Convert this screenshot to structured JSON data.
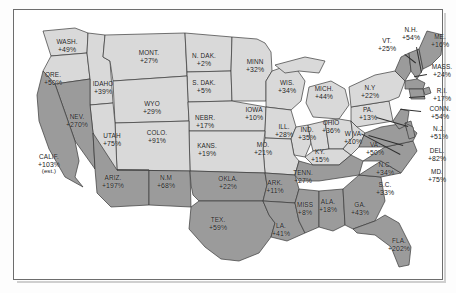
{
  "figure": {
    "kind": "choropleth-map",
    "region": "United States",
    "unit": "percent",
    "shade_high_hex": "#9b9b9b",
    "shade_low_hex": "#d9d9d9",
    "frame_hex": "#6d6d6d",
    "text_hex": "#1b1b1b"
  },
  "chart_data": {
    "type": "map",
    "title": "",
    "xlabel": "",
    "ylabel": "",
    "categories": [
      "WASH.",
      "ORE.",
      "IDAHO",
      "MONT.",
      "N. DAK.",
      "S. DAK.",
      "MINN",
      "WIS.",
      "MICH.",
      "WYO",
      "NEBR.",
      "IOWA",
      "ILL.",
      "IND.",
      "OHIO",
      "PA.",
      "N.Y",
      "VT.",
      "N.H.",
      "ME.",
      "MASS.",
      "R.I.",
      "CONN.",
      "N.J.",
      "DEL.",
      "MD.",
      "W VA",
      "VA.",
      "KY.",
      "MO.",
      "KANS.",
      "COLO.",
      "UTAH",
      "NEV.",
      "CALIF.",
      "ARIZ.",
      "N.M",
      "OKLA.",
      "TEX.",
      "ARK.",
      "LA.",
      "MISS.",
      "ALA.",
      "TENN.",
      "GA.",
      "S.C.",
      "N.C.",
      "FLA."
    ],
    "values": [
      49,
      50,
      39,
      27,
      2,
      5,
      32,
      34,
      44,
      29,
      17,
      10,
      28,
      35,
      36,
      13,
      22,
      25,
      54,
      16,
      24,
      17,
      54,
      51,
      82,
      75,
      10,
      50,
      15,
      21,
      19,
      91,
      75,
      270,
      103,
      197,
      68,
      22,
      59,
      11,
      41,
      8,
      18,
      27,
      43,
      33,
      34,
      202
    ],
    "legend": []
  },
  "states": [
    {
      "name": "WASH.",
      "value": "+49%",
      "x": 54,
      "y": 37,
      "shade": "low"
    },
    {
      "name": "ORE.",
      "value": "+50%",
      "x": 40,
      "y": 70,
      "shade": "low"
    },
    {
      "name": "IDAHO",
      "value": "+39%",
      "x": 90,
      "y": 79,
      "shade": "low"
    },
    {
      "name": "MONT.",
      "value": "+27%",
      "x": 136,
      "y": 48,
      "shade": "low"
    },
    {
      "name": "N. DAK.",
      "value": "+2%",
      "x": 191,
      "y": 51,
      "shade": "low"
    },
    {
      "name": "S. DAK.",
      "value": "+5%",
      "x": 191,
      "y": 78,
      "shade": "low"
    },
    {
      "name": "MINN",
      "value": "+32%",
      "x": 242,
      "y": 57,
      "shade": "low"
    },
    {
      "name": "WIS.",
      "value": "+34%",
      "x": 274,
      "y": 78,
      "shade": "low"
    },
    {
      "name": "MICH.",
      "value": "+44%",
      "x": 311,
      "y": 84,
      "shade": "low"
    },
    {
      "name": "WYO",
      "value": "+29%",
      "x": 139,
      "y": 99,
      "shade": "low"
    },
    {
      "name": "NEBR.",
      "value": "+17%",
      "x": 192,
      "y": 113,
      "shade": "low"
    },
    {
      "name": "IOWA",
      "value": "+10%",
      "x": 241,
      "y": 105,
      "shade": "low"
    },
    {
      "name": "ILL.",
      "value": "+28%",
      "x": 271,
      "y": 122,
      "shade": "low"
    },
    {
      "name": "IND.",
      "value": "+35%",
      "x": 294,
      "y": 125,
      "shade": "low"
    },
    {
      "name": "OHIO",
      "value": "+36%",
      "x": 318,
      "y": 118,
      "shade": "low"
    },
    {
      "name": "PA.",
      "value": "+13%",
      "x": 355,
      "y": 105,
      "shade": "low"
    },
    {
      "name": "N.Y",
      "value": "+22%",
      "x": 357,
      "y": 83,
      "shade": "low"
    },
    {
      "name": "KY.",
      "value": "+15%",
      "x": 307,
      "y": 147,
      "shade": "low"
    },
    {
      "name": "MO.",
      "value": "+21%",
      "x": 250,
      "y": 140,
      "shade": "low"
    },
    {
      "name": "KANS.",
      "value": "+19%",
      "x": 194,
      "y": 141,
      "shade": "low"
    },
    {
      "name": "COLO.",
      "value": "+91%",
      "x": 144,
      "y": 128,
      "shade": "low"
    },
    {
      "name": "UTAH",
      "value": "+75%",
      "x": 99,
      "y": 131,
      "shade": "low"
    },
    {
      "name": "NEV.",
      "value": "+270%",
      "x": 64,
      "y": 112,
      "shade": "high"
    },
    {
      "name": "W VA",
      "value": "+10%",
      "x": 340,
      "y": 129,
      "shade": "low"
    }
  ],
  "states_high": [
    {
      "name": "CALIF.",
      "value": "+103%",
      "note": "(est.)",
      "x": 36,
      "y": 155
    },
    {
      "name": "ARIZ.",
      "value": "+197%",
      "x": 100,
      "y": 173
    },
    {
      "name": "N.M",
      "value": "+68%",
      "x": 153,
      "y": 173
    },
    {
      "name": "OKLA.",
      "value": "+22%",
      "x": 215,
      "y": 174
    },
    {
      "name": "TEX.",
      "value": "+59%",
      "x": 205,
      "y": 215
    },
    {
      "name": "ARK.",
      "value": "+11%",
      "x": 262,
      "y": 178
    },
    {
      "name": "LA.",
      "value": "+41%",
      "x": 268,
      "y": 221
    },
    {
      "name": "MISS",
      "value": "+8%",
      "x": 292,
      "y": 200
    },
    {
      "name": "ALA.",
      "value": "+18%",
      "x": 315,
      "y": 197
    },
    {
      "name": "GA.",
      "value": "+43%",
      "x": 347,
      "y": 200
    },
    {
      "name": "S.C.",
      "value": "+33%",
      "x": 372,
      "y": 180
    },
    {
      "name": "N.C.",
      "value": "+34%",
      "x": 372,
      "y": 160
    },
    {
      "name": "VA.",
      "value": "+50%",
      "x": 362,
      "y": 140
    },
    {
      "name": "FLA.",
      "value": "+202%",
      "x": 386,
      "y": 236
    },
    {
      "name": "TENN.",
      "value": "+27%",
      "x": 290,
      "y": 168
    }
  ],
  "callouts": [
    {
      "name": "VT.",
      "value": "+25%",
      "x": 374,
      "y": 36,
      "lx": 392,
      "ly": 45,
      "len": 14,
      "ang": 38
    },
    {
      "name": "N.H.",
      "value": "+54%",
      "x": 398,
      "y": 25,
      "lx": 404,
      "ly": 38,
      "len": 26,
      "ang": 79
    },
    {
      "name": "ME.",
      "value": "+16%",
      "x": 427,
      "y": 32,
      "lx": 0,
      "ly": 0,
      "len": 0,
      "ang": 0
    },
    {
      "name": "MASS.",
      "value": "+24%",
      "x": 429,
      "y": 62,
      "lx": 414,
      "ly": 66,
      "len": 13,
      "ang": 170
    },
    {
      "name": "R.I.",
      "value": "+17%",
      "x": 429,
      "y": 86,
      "lx": 412,
      "ly": 88,
      "len": 16,
      "ang": 176
    },
    {
      "name": "CONN.",
      "value": "+54%",
      "x": 427,
      "y": 104,
      "lx": 408,
      "ly": 103,
      "len": 21,
      "ang": 186
    },
    {
      "name": "N.J.",
      "value": "+51%",
      "x": 426,
      "y": 124,
      "lx": 395,
      "ly": 118,
      "len": 33,
      "ang": 196
    },
    {
      "name": "DEL.",
      "value": "+82%",
      "x": 424,
      "y": 146,
      "lx": 390,
      "ly": 137,
      "len": 36,
      "ang": 196
    },
    {
      "name": "MD.",
      "value": "+75%",
      "x": 424,
      "y": 167,
      "lx": 387,
      "ly": 146,
      "len": 44,
      "ang": 208
    }
  ]
}
